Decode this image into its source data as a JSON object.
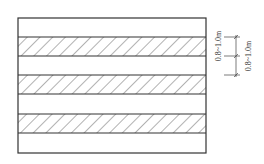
{
  "diagram": {
    "type": "striped-layout-section",
    "outer_rect": {
      "x": 18,
      "y": 18,
      "width": 188,
      "height": 135
    },
    "bands": [
      {
        "kind": "blank",
        "y": 18,
        "height": 19
      },
      {
        "kind": "hatched",
        "y": 37,
        "height": 19
      },
      {
        "kind": "blank",
        "y": 56,
        "height": 19
      },
      {
        "kind": "hatched",
        "y": 75,
        "height": 19
      },
      {
        "kind": "blank",
        "y": 94,
        "height": 20
      },
      {
        "kind": "hatched",
        "y": 114,
        "height": 19
      },
      {
        "kind": "blank",
        "y": 133,
        "height": 20
      }
    ],
    "colors": {
      "line": "#333333",
      "hatch": "#555555",
      "background": "#ffffff"
    },
    "dimensions": [
      {
        "label": "0.8~1.0m",
        "from_y": 37,
        "to_y": 56
      },
      {
        "label": "0.8~1.0m",
        "from_y": 56,
        "to_y": 75
      }
    ]
  }
}
